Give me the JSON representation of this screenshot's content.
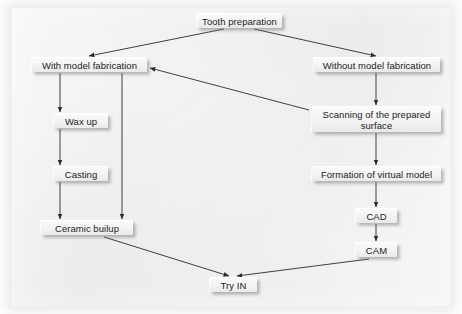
{
  "diagram": {
    "background_color": "#ececec",
    "page_color": "#fdfdfd",
    "node_fill": "#f3f3f3",
    "line_color": "#2b2b2b",
    "nodes": [
      {
        "id": "tooth_preparation",
        "label": "Tooth preparation",
        "x": 196,
        "y": 13,
        "w": 86,
        "h": 15
      },
      {
        "id": "with_model",
        "label": "With model fabrication",
        "x": 31,
        "y": 57,
        "w": 116,
        "h": 15
      },
      {
        "id": "without_model",
        "label": "Without model fabrication",
        "x": 313,
        "y": 57,
        "w": 127,
        "h": 15
      },
      {
        "id": "wax_up",
        "label": "Wax up",
        "x": 53,
        "y": 113,
        "w": 55,
        "h": 15
      },
      {
        "id": "scanning",
        "label": "Scanning of the prepared surface",
        "x": 311,
        "y": 106,
        "w": 130,
        "h": 26
      },
      {
        "id": "casting",
        "label": "Casting",
        "x": 53,
        "y": 166,
        "w": 55,
        "h": 15
      },
      {
        "id": "formation_virtual_model",
        "label": "Formation of virtual model",
        "x": 311,
        "y": 166,
        "w": 130,
        "h": 15
      },
      {
        "id": "cad",
        "label": "CAD",
        "x": 355,
        "y": 208,
        "w": 42,
        "h": 15
      },
      {
        "id": "ceramic_buildup",
        "label": "Ceramic builup",
        "x": 40,
        "y": 220,
        "w": 93,
        "h": 15
      },
      {
        "id": "cam",
        "label": "CAM",
        "x": 355,
        "y": 242,
        "w": 42,
        "h": 15
      },
      {
        "id": "try_in",
        "label": "Try IN",
        "x": 209,
        "y": 277,
        "w": 48,
        "h": 15
      }
    ],
    "edges": [
      {
        "id": "edge-tooth-to-with-model",
        "from": "tooth_preparation",
        "to": "with_model",
        "path": "M 224 29 L 89 56"
      },
      {
        "id": "edge-tooth-to-without-model",
        "from": "tooth_preparation",
        "to": "without_model",
        "path": "M 254 29 L 376 56"
      },
      {
        "id": "edge-with-model-to-wax-up",
        "from": "with_model",
        "to": "wax_up",
        "path": "M 60 73 L 60 112"
      },
      {
        "id": "edge-with-model-to-ceramic",
        "from": "with_model",
        "to": "ceramic_buildup",
        "path": "M 122 73 L 122 219"
      },
      {
        "id": "edge-wax-up-to-casting",
        "from": "wax_up",
        "to": "casting",
        "path": "M 60 129 L 60 165"
      },
      {
        "id": "edge-casting-to-ceramic",
        "from": "casting",
        "to": "ceramic_buildup",
        "path": "M 60 182 L 60 219"
      },
      {
        "id": "edge-without-model-to-scanning",
        "from": "without_model",
        "to": "scanning",
        "path": "M 376 73 L 376 105"
      },
      {
        "id": "edge-scanning-to-with-model",
        "from": "scanning",
        "to": "with_model",
        "path": "M 309 110 L 150 68"
      },
      {
        "id": "edge-scanning-to-formation",
        "from": "scanning",
        "to": "formation_virtual_model",
        "path": "M 376 133 L 376 165"
      },
      {
        "id": "edge-formation-to-cad",
        "from": "formation_virtual_model",
        "to": "cad",
        "path": "M 376 182 L 376 207"
      },
      {
        "id": "edge-cad-to-cam",
        "from": "cad",
        "to": "cam",
        "path": "M 376 224 L 376 241"
      },
      {
        "id": "edge-ceramic-to-try-in",
        "from": "ceramic_buildup",
        "to": "try_in",
        "path": "M 104 237 L 229 276"
      },
      {
        "id": "edge-cam-to-try-in",
        "from": "cam",
        "to": "try_in",
        "path": "M 369 259 L 237 276"
      }
    ]
  }
}
